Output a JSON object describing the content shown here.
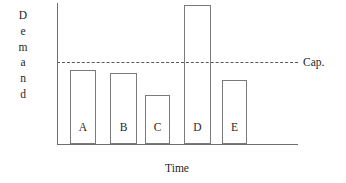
{
  "chart_data": {
    "type": "bar",
    "title": "",
    "subtitle": "",
    "xlabel": "Time",
    "ylabel": "Demand",
    "categories": [
      "A",
      "B",
      "C",
      "D",
      "E"
    ],
    "values": [
      75,
      72,
      50,
      140,
      65
    ],
    "ylim": [
      0,
      142
    ],
    "grid": false,
    "legend_position": "right",
    "annotations": [
      {
        "name": "capacity-line",
        "label": "Cap.",
        "value": 83,
        "style": "dashed-horizontal-line",
        "note": "Capacity threshold; bar D exceeds it"
      }
    ],
    "series": [
      {
        "name": "Demand",
        "values": [
          75,
          72,
          50,
          140,
          65
        ]
      }
    ],
    "bars": [
      {
        "category": "A",
        "value": 75,
        "x": 13,
        "width": 26,
        "top": 67,
        "exceeds_capacity": false
      },
      {
        "category": "B",
        "value": 72,
        "x": 53,
        "width": 27,
        "top": 70,
        "exceeds_capacity": false
      },
      {
        "category": "C",
        "value": 50,
        "x": 88,
        "width": 25,
        "top": 92,
        "exceeds_capacity": false
      },
      {
        "category": "D",
        "value": 140,
        "x": 127,
        "width": 27,
        "top": 2,
        "exceeds_capacity": true
      },
      {
        "category": "E",
        "value": 65,
        "x": 165,
        "width": 25,
        "top": 77,
        "exceeds_capacity": false
      }
    ]
  },
  "axes": {
    "y_title_letters": [
      "D",
      "e",
      "m",
      "a",
      "n",
      "d"
    ],
    "y_title_text": "Demand",
    "x_title_text": "Time"
  },
  "capacity": {
    "label": "Cap."
  },
  "colors": {
    "background": "#ffffff",
    "axis": "#6e6e6e",
    "bar_outline": "#7a7a7a",
    "bar_fill": "#ffffff",
    "capacity_line": "#5a5a5a",
    "text": "#1f1f1f"
  }
}
